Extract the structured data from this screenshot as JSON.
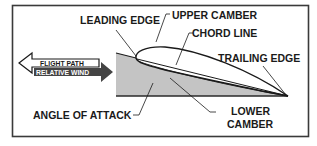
{
  "diagram": {
    "labels": {
      "leading_edge": "LEADING EDGE",
      "upper_camber": "UPPER CAMBER",
      "chord_line": "CHORD LINE",
      "trailing_edge": "TRAILING EDGE",
      "angle_of_attack": "ANGLE OF ATTACK",
      "lower_camber_1": "LOWER",
      "lower_camber_2": "CAMBER"
    },
    "arrows": {
      "flight_path": "FLIGHT PATH",
      "relative_wind": "RELATIVE WIND"
    },
    "colors": {
      "frame": "#3a3a3a",
      "shade": "#c4c4c4",
      "ink": "#1a1a1a",
      "relative_wind_fill": "#444444",
      "flight_path_fill": "#ffffff"
    }
  }
}
